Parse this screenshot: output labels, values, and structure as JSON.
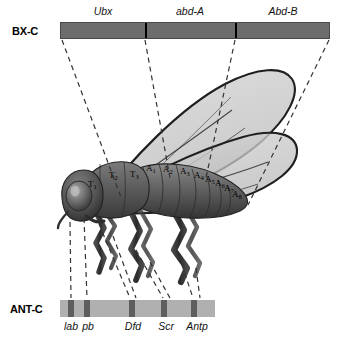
{
  "figure": {
    "background_color": "#ffffff",
    "width": 341,
    "height": 338
  },
  "bx_c": {
    "cluster_label": "BX-C",
    "bar_color": "#6d6d6d",
    "divider_color": "#000000",
    "genes": [
      {
        "name": "Ubx",
        "label_x": 103,
        "center_x": 103
      },
      {
        "name": "abd-A",
        "label_x": 190,
        "center_x": 190
      },
      {
        "name": "Abd-B",
        "label_x": 283,
        "center_x": 283
      }
    ],
    "dividers_x": [
      145,
      235
    ]
  },
  "ant_c": {
    "cluster_label": "ANT-C",
    "bar_color": "#b0b0b0",
    "gene_block_color": "#5e5e5e",
    "genes": [
      {
        "name": "lab",
        "block_x": 68,
        "label_x": 71
      },
      {
        "name": "pb",
        "block_x": 84,
        "label_x": 87
      },
      {
        "name": "Dfd",
        "block_x": 129,
        "label_x": 132
      },
      {
        "name": "Scr",
        "block_x": 161,
        "label_x": 164
      },
      {
        "name": "Antp",
        "block_x": 191,
        "label_x": 194
      }
    ]
  },
  "fly": {
    "body_color": "#5a5a5a",
    "wing_fill": "#c9c9c9",
    "wing_vein_color": "#222222",
    "segments": [
      {
        "label": "T",
        "sub": "1",
        "x": 88,
        "y": 182
      },
      {
        "label": "T",
        "sub": "2",
        "x": 110,
        "y": 173
      },
      {
        "label": "T",
        "sub": "3",
        "x": 131,
        "y": 172
      },
      {
        "label": "A",
        "sub": "1",
        "x": 148,
        "y": 167
      },
      {
        "label": "A",
        "sub": "2",
        "x": 165,
        "y": 168
      },
      {
        "label": "A",
        "sub": "3",
        "x": 182,
        "y": 170
      },
      {
        "label": "A",
        "sub": "4",
        "x": 196,
        "y": 173
      },
      {
        "label": "A",
        "sub": "5",
        "x": 208,
        "y": 176
      },
      {
        "label": "A",
        "sub": "6",
        "x": 219,
        "y": 180
      },
      {
        "label": "A",
        "sub": "7",
        "x": 228,
        "y": 184
      },
      {
        "label": "A",
        "sub": "8",
        "x": 236,
        "y": 190
      }
    ]
  },
  "connectors": {
    "style": "dashed",
    "color": "#333333",
    "upper_count": 4,
    "lower_count": 10
  }
}
